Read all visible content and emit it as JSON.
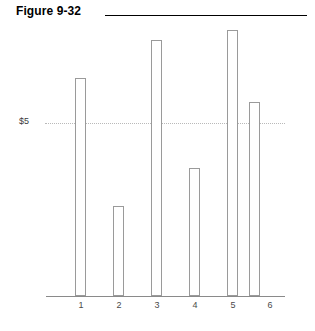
{
  "header": {
    "figure_label": "Figure 9-32",
    "rule_color": "#000000"
  },
  "axis": {
    "y_tick_label": "$5",
    "x_tick_labels": [
      "1",
      "2",
      "3",
      "4",
      "5",
      "6"
    ],
    "axis_color": "#8a8a8a",
    "gridline_color": "#b9b9b9"
  },
  "bars": {
    "fill": "#ffffff",
    "stroke": "#9a9a9a"
  },
  "chart_data": {
    "type": "bar",
    "title": "Figure 9-32",
    "categories": [
      "1",
      "2",
      "3",
      "4",
      "5",
      "6"
    ],
    "values": [
      6.3,
      2.6,
      7.4,
      3.7,
      7.7,
      5.6
    ],
    "xlabel": "",
    "ylabel": "",
    "ylim": [
      0,
      8
    ],
    "yticks": [
      5
    ],
    "ytick_labels": [
      "$5"
    ],
    "grid": true,
    "legend": "none",
    "bar_fill": "#ffffff",
    "bar_stroke": "#9a9a9a"
  }
}
